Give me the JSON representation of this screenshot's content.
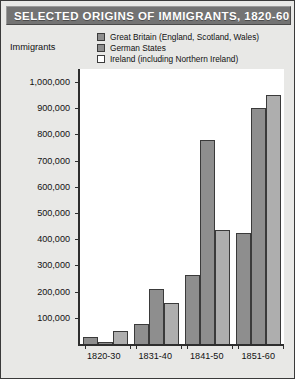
{
  "title": "SELECTED ORIGINS OF IMMIGRANTS, 1820-60",
  "axis_label": "Immigrants",
  "colors": {
    "title_bar": "#737373",
    "title_text": "#ffffff",
    "page_background": "#e8e8e6",
    "plot_background": "#ffffff",
    "axis": "#2e2e2e",
    "great_britain": "#8e8e8e",
    "german_states": "#8e8e8e",
    "ireland": "#aeaeae"
  },
  "legend": {
    "items": [
      {
        "label": "Great Britain (England, Scotland, Wales)",
        "swatch": "#8e8e8e"
      },
      {
        "label": "German States",
        "swatch": "#8e8e8e"
      },
      {
        "label": "Ireland (including Northern Ireland)",
        "swatch": "#ffffff"
      }
    ]
  },
  "chart_data": {
    "type": "bar",
    "title": "SELECTED ORIGINS OF IMMIGRANTS, 1820-60",
    "xlabel": "",
    "ylabel": "Immigrants",
    "categories": [
      "1820-30",
      "1831-40",
      "1841-50",
      "1851-60"
    ],
    "series": [
      {
        "name": "Great Britain (England, Scotland, Wales)",
        "values": [
          25000,
          75000,
          265000,
          425000
        ]
      },
      {
        "name": "German States",
        "values": [
          7000,
          210000,
          780000,
          900000
        ]
      },
      {
        "name": "Ireland (including Northern Ireland)",
        "values": [
          51000,
          155000,
          435000,
          950000
        ]
      }
    ],
    "ylim": [
      0,
      1050000
    ],
    "ytick_values": [
      100000,
      200000,
      300000,
      400000,
      500000,
      600000,
      700000,
      800000,
      900000,
      1000000
    ],
    "ytick_labels": [
      "100,000",
      "200,000",
      "300,000",
      "400,000",
      "500,000",
      "600,000",
      "700,000",
      "800,000",
      "900,000",
      "1,000,000"
    ],
    "grid": false,
    "legend_position": "top-right"
  }
}
